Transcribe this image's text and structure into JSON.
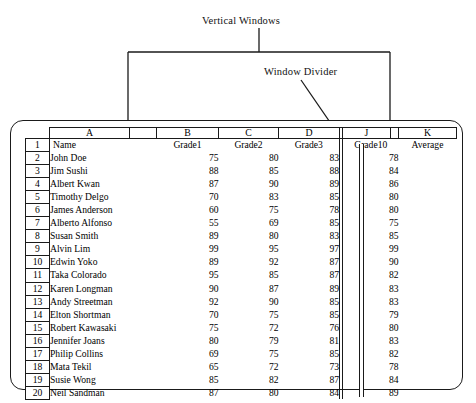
{
  "annotations": {
    "vertical_windows_label": "Vertical Windows",
    "window_divider_label": "Window Divider"
  },
  "spreadsheet": {
    "column_letters": [
      "A",
      "B",
      "C",
      "D",
      "J",
      "K"
    ],
    "header_row_number": "1",
    "headers": [
      "Name",
      "Grade1",
      "Grade2",
      "Grade3",
      "Grade10",
      "Average"
    ],
    "rows": [
      {
        "n": "2",
        "name": "John Doe",
        "g1": "75",
        "g2": "80",
        "g3": "83",
        "g10": "78",
        "avg": ""
      },
      {
        "n": "3",
        "name": "Jim Sushi",
        "g1": "88",
        "g2": "85",
        "g3": "88",
        "g10": "84",
        "avg": ""
      },
      {
        "n": "4",
        "name": "Albert Kwan",
        "g1": "87",
        "g2": "90",
        "g3": "89",
        "g10": "86",
        "avg": ""
      },
      {
        "n": "5",
        "name": "Timothy Delgo",
        "g1": "70",
        "g2": "83",
        "g3": "85",
        "g10": "80",
        "avg": ""
      },
      {
        "n": "6",
        "name": "James Anderson",
        "g1": "60",
        "g2": "75",
        "g3": "78",
        "g10": "80",
        "avg": ""
      },
      {
        "n": "7",
        "name": "Alberto Alfonso",
        "g1": "55",
        "g2": "69",
        "g3": "85",
        "g10": "75",
        "avg": ""
      },
      {
        "n": "8",
        "name": "Susan Smith",
        "g1": "89",
        "g2": "80",
        "g3": "83",
        "g10": "85",
        "avg": ""
      },
      {
        "n": "9",
        "name": "Alvin Lim",
        "g1": "99",
        "g2": "95",
        "g3": "97",
        "g10": "99",
        "avg": ""
      },
      {
        "n": "10",
        "name": "Edwin Yoko",
        "g1": "89",
        "g2": "92",
        "g3": "87",
        "g10": "90",
        "avg": ""
      },
      {
        "n": "11",
        "name": "Taka Colorado",
        "g1": "95",
        "g2": "85",
        "g3": "87",
        "g10": "82",
        "avg": ""
      },
      {
        "n": "12",
        "name": "Karen Longman",
        "g1": "90",
        "g2": "87",
        "g3": "89",
        "g10": "83",
        "avg": ""
      },
      {
        "n": "13",
        "name": "Andy Streetman",
        "g1": "92",
        "g2": "90",
        "g3": "85",
        "g10": "83",
        "avg": ""
      },
      {
        "n": "14",
        "name": "Elton Shortman",
        "g1": "70",
        "g2": "75",
        "g3": "85",
        "g10": "79",
        "avg": ""
      },
      {
        "n": "15",
        "name": "Robert Kawasaki",
        "g1": "75",
        "g2": "72",
        "g3": "76",
        "g10": "80",
        "avg": ""
      },
      {
        "n": "16",
        "name": "Jennifer Joans",
        "g1": "80",
        "g2": "79",
        "g3": "81",
        "g10": "83",
        "avg": ""
      },
      {
        "n": "17",
        "name": "Philip Collins",
        "g1": "69",
        "g2": "75",
        "g3": "85",
        "g10": "82",
        "avg": ""
      },
      {
        "n": "18",
        "name": "Mata Tekil",
        "g1": "65",
        "g2": "72",
        "g3": "73",
        "g10": "78",
        "avg": ""
      },
      {
        "n": "19",
        "name": "Susie Wong",
        "g1": "85",
        "g2": "82",
        "g3": "87",
        "g10": "84",
        "avg": ""
      },
      {
        "n": "20",
        "name": "Neil Sandman",
        "g1": "87",
        "g2": "80",
        "g3": "84",
        "g10": "89",
        "avg": ""
      }
    ]
  }
}
